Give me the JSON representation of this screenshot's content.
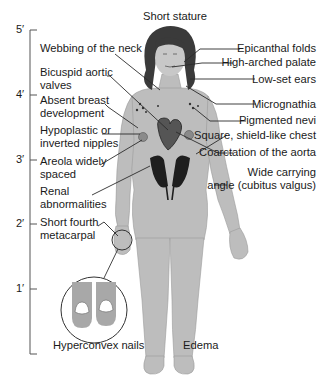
{
  "title": "Short stature",
  "scale": {
    "ticks": [
      {
        "label": "5′",
        "y": 30
      },
      {
        "label": "4′",
        "y": 95
      },
      {
        "label": "3′",
        "y": 160
      },
      {
        "label": "2′",
        "y": 224
      },
      {
        "label": "1′",
        "y": 289
      }
    ]
  },
  "labels_left": [
    {
      "id": "webbing",
      "lines": [
        "Webbing of the neck"
      ]
    },
    {
      "id": "bicuspid",
      "lines": [
        "Bicuspid aortic",
        "valves"
      ]
    },
    {
      "id": "breast",
      "lines": [
        "Absent breast",
        "development"
      ]
    },
    {
      "id": "nipples",
      "lines": [
        "Hypoplastic or",
        "inverted nipples"
      ]
    },
    {
      "id": "areola",
      "lines": [
        "Areola widely",
        "spaced"
      ]
    },
    {
      "id": "renal",
      "lines": [
        "Renal",
        "abnormalities"
      ]
    },
    {
      "id": "metacarpal",
      "lines": [
        "Short fourth",
        "metacarpal"
      ]
    }
  ],
  "labels_right": [
    {
      "id": "epicanthal",
      "lines": [
        "Epicanthal folds"
      ]
    },
    {
      "id": "palate",
      "lines": [
        "High-arched palate"
      ]
    },
    {
      "id": "ears",
      "lines": [
        "Low-set ears"
      ]
    },
    {
      "id": "micrognathia",
      "lines": [
        "Micrognathia"
      ]
    },
    {
      "id": "nevi",
      "lines": [
        "Pigmented nevi"
      ]
    },
    {
      "id": "chest",
      "lines": [
        "Square, shield-like chest"
      ]
    },
    {
      "id": "coarctation",
      "lines": [
        "Coarctation of the aorta"
      ]
    },
    {
      "id": "cubitus",
      "lines": [
        "Wide carrying",
        "angle (cubitus valgus)"
      ]
    }
  ],
  "labels_bottom": {
    "nails": "Hyperconvex nails",
    "edema": "Edema"
  },
  "colors": {
    "body": "#bdbdbd",
    "body_shade": "#a8a8a8",
    "hair": "#3a3a3a",
    "organ": "#2a2a2a",
    "line": "#2b2b2b"
  }
}
